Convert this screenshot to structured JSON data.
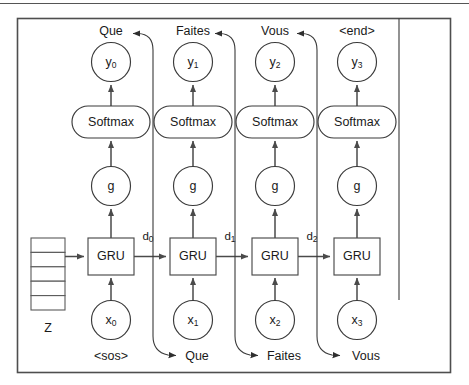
{
  "figure": {
    "latent_label": "Z",
    "latent_cells": 5,
    "softmax_label": "Softmax",
    "gru_label": "GRU",
    "g_label": "g",
    "start_token": "<sos>",
    "end_token": "<end>",
    "colors": {
      "stroke": "#4a4a4a",
      "text": "#1a1a1a",
      "frame": "#4e4e4e",
      "background": "#ffffff"
    },
    "steps": [
      {
        "index": 0,
        "output_node": "y",
        "output_sub": "0",
        "output_word": "Que",
        "input_node": "x",
        "input_sub": "0",
        "input_word": "<sos>",
        "state_label": "d",
        "state_sub": "0",
        "feedback_target": "Que",
        "has_feedback": true,
        "has_state_out": true
      },
      {
        "index": 1,
        "output_node": "y",
        "output_sub": "1",
        "output_word": "Faites",
        "input_node": "x",
        "input_sub": "1",
        "input_word": "Que",
        "state_label": "d",
        "state_sub": "1",
        "feedback_target": "Faites",
        "has_feedback": true,
        "has_state_out": true
      },
      {
        "index": 2,
        "output_node": "y",
        "output_sub": "2",
        "output_word": "Vous",
        "input_node": "x",
        "input_sub": "2",
        "input_word": "Faites",
        "state_label": "d",
        "state_sub": "2",
        "feedback_target": "Vous",
        "has_feedback": true,
        "has_state_out": true
      },
      {
        "index": 3,
        "output_node": "y",
        "output_sub": "3",
        "output_word": "<end>",
        "input_node": "x",
        "input_sub": "3",
        "input_word": "Vous",
        "state_label": "",
        "state_sub": "",
        "feedback_target": "",
        "has_feedback": false,
        "has_state_out": false
      }
    ]
  }
}
